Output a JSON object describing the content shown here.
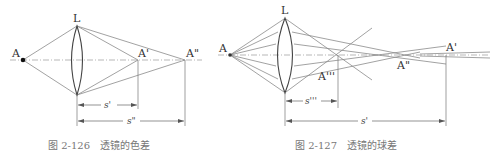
{
  "figures": [
    {
      "id": "fig-2-126",
      "caption": "图 2-126   透镜的色差",
      "labels": {
        "object": "A",
        "lens": "L",
        "image1": "A'",
        "image2": "A\"",
        "dim1": "s'",
        "dim2": "s\""
      }
    },
    {
      "id": "fig-2-127",
      "caption": "图 2-127   透镜的球差",
      "labels": {
        "object": "A",
        "lens": "L",
        "image1": "A'",
        "image2": "A\"",
        "image3": "A'''",
        "dim1": "s'''",
        "dim2": "s'"
      }
    }
  ],
  "colors": {
    "ray": "#8a8a8a",
    "lens": "#444444",
    "text": "#333333",
    "caption": "#777777"
  }
}
